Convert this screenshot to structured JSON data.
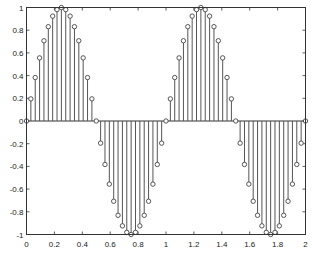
{
  "chart_data": {
    "type": "stem",
    "title": "",
    "xlabel": "",
    "ylabel": "",
    "xlim": [
      0,
      2
    ],
    "ylim": [
      -1,
      1
    ],
    "grid": false,
    "legend": null,
    "function": "y = sin(2*pi*x)",
    "sample_step": 0.03125,
    "x_ticks": [
      0,
      0.2,
      0.4,
      0.6,
      0.8,
      1,
      1.2,
      1.4,
      1.6,
      1.8,
      2
    ],
    "x_tick_labels": [
      "0",
      "0.2",
      "0.4",
      "0.6",
      "0.8",
      "1",
      "1.2",
      "1.4",
      "1.6",
      "1.8",
      "2"
    ],
    "y_ticks": [
      1,
      0.8,
      0.6,
      0.4,
      0.2,
      0,
      -0.2,
      -0.4,
      -0.6,
      -0.8,
      -1
    ],
    "y_tick_labels": [
      "1",
      "0.8",
      "0.6",
      "0.4",
      "0.2",
      "0",
      "-0.2",
      "-0.4",
      "-0.6",
      "-0.8",
      "-1"
    ],
    "series": [
      {
        "name": "sin(2πx)",
        "marker": "circle",
        "color": "#444444",
        "x": [
          0,
          0.03125,
          0.0625,
          0.09375,
          0.125,
          0.15625,
          0.1875,
          0.21875,
          0.25,
          0.28125,
          0.3125,
          0.34375,
          0.375,
          0.40625,
          0.4375,
          0.46875,
          0.5,
          0.53125,
          0.5625,
          0.59375,
          0.625,
          0.65625,
          0.6875,
          0.71875,
          0.75,
          0.78125,
          0.8125,
          0.84375,
          0.875,
          0.90625,
          0.9375,
          0.96875,
          1,
          1.03125,
          1.0625,
          1.09375,
          1.125,
          1.15625,
          1.1875,
          1.21875,
          1.25,
          1.28125,
          1.3125,
          1.34375,
          1.375,
          1.40625,
          1.4375,
          1.46875,
          1.5,
          1.53125,
          1.5625,
          1.59375,
          1.625,
          1.65625,
          1.6875,
          1.71875,
          1.75,
          1.78125,
          1.8125,
          1.84375,
          1.875,
          1.90625,
          1.9375,
          1.96875,
          2
        ],
        "values": [
          0,
          0.195,
          0.383,
          0.556,
          0.707,
          0.831,
          0.924,
          0.981,
          1,
          0.981,
          0.924,
          0.831,
          0.707,
          0.556,
          0.383,
          0.195,
          0,
          -0.195,
          -0.383,
          -0.556,
          -0.707,
          -0.831,
          -0.924,
          -0.981,
          -1,
          -0.981,
          -0.924,
          -0.831,
          -0.707,
          -0.556,
          -0.383,
          -0.195,
          0,
          0.195,
          0.383,
          0.556,
          0.707,
          0.831,
          0.924,
          0.981,
          1,
          0.981,
          0.924,
          0.831,
          0.707,
          0.556,
          0.383,
          0.195,
          0,
          -0.195,
          -0.383,
          -0.556,
          -0.707,
          -0.831,
          -0.924,
          -0.981,
          -1,
          -0.981,
          -0.924,
          -0.831,
          -0.707,
          -0.556,
          -0.383,
          -0.195,
          0
        ]
      }
    ]
  },
  "colors": {
    "background": "#ffffff",
    "axes": "#333333",
    "stem": "#555555",
    "marker_edge": "#444444"
  }
}
